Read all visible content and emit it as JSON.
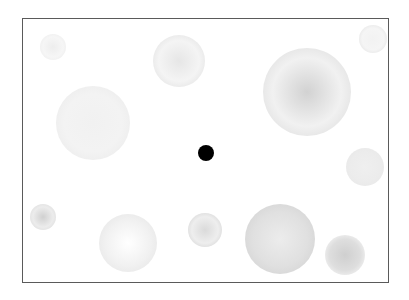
{
  "stimulus": {
    "frame": {
      "left": 22,
      "top": 18,
      "right": 389,
      "bottom": 283,
      "border_color": "#5a5a5a",
      "background": "#ffffff"
    },
    "fixation": {
      "cx": 206,
      "cy": 153,
      "r": 8,
      "color": "#000000"
    },
    "discs": [
      {
        "id": "top-left-small",
        "cx": 53,
        "cy": 47,
        "r": 13,
        "center": "#ededed",
        "mid": "#f6f6f6",
        "edge": "#ececec"
      },
      {
        "id": "top-center",
        "cx": 179,
        "cy": 61,
        "r": 26,
        "center": "#e6e6e6",
        "mid": "#f4f4f4",
        "edge": "#e2e2e2"
      },
      {
        "id": "top-right-large",
        "cx": 307,
        "cy": 92,
        "r": 44,
        "center": "#d2d2d2",
        "mid": "#f1f1f1",
        "edge": "#dedede"
      },
      {
        "id": "top-right-corner",
        "cx": 373,
        "cy": 39,
        "r": 14,
        "center": "#f2f2f2",
        "mid": "#f5f5f5",
        "edge": "#e3e3e3"
      },
      {
        "id": "left-large",
        "cx": 93,
        "cy": 123,
        "r": 37,
        "center": "#f1f1f1",
        "mid": "#f3f3f3",
        "edge": "#ebebeb"
      },
      {
        "id": "right-mid",
        "cx": 365,
        "cy": 167,
        "r": 19,
        "center": "#efefef",
        "mid": "#ececec",
        "edge": "#e8e8e8"
      },
      {
        "id": "bottom-left-small",
        "cx": 43,
        "cy": 217,
        "r": 13,
        "center": "#d0d0d0",
        "mid": "#ececec",
        "edge": "#dcdcdc"
      },
      {
        "id": "bottom-left-mid",
        "cx": 128,
        "cy": 243,
        "r": 29,
        "center": "#ffffff",
        "mid": "#f1f1f1",
        "edge": "#e6e6e6"
      },
      {
        "id": "bottom-center-ring",
        "cx": 205,
        "cy": 230,
        "r": 17,
        "center": "#dadada",
        "mid": "#eeeeee",
        "edge": "#d4d4d4"
      },
      {
        "id": "bottom-large",
        "cx": 280,
        "cy": 239,
        "r": 35,
        "center": "#ececec",
        "mid": "#e0e0e0",
        "edge": "#d3d3d3"
      },
      {
        "id": "bottom-right",
        "cx": 345,
        "cy": 255,
        "r": 20,
        "center": "#cfcfcf",
        "mid": "#dedede",
        "edge": "#f7f7f7"
      }
    ]
  }
}
